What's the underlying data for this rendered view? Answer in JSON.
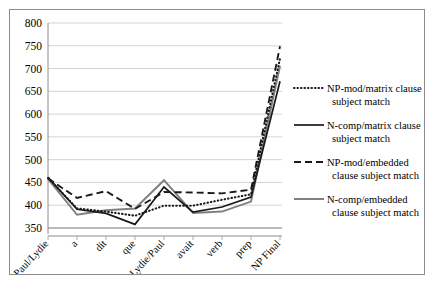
{
  "chart_data": {
    "type": "line",
    "title": "",
    "xlabel": "",
    "ylabel": "",
    "ylim": [
      350,
      800
    ],
    "ytick_step": 50,
    "yticks": [
      350,
      400,
      450,
      500,
      550,
      600,
      650,
      700,
      750,
      800
    ],
    "grid": true,
    "legend_position": "right",
    "categories": [
      "Paul/Lydie",
      "a",
      "dit",
      "que",
      "Lydie/Paul",
      "avait",
      "verb",
      "prep",
      "NP Final"
    ],
    "series": [
      {
        "name": "NP-mod/matrix clause subject match",
        "style": "dotted",
        "color": "#1a1a1a",
        "values": [
          460,
          393,
          386,
          377,
          399,
          399,
          412,
          424,
          722
        ]
      },
      {
        "name": "N-comp/matrix clause subject match",
        "style": "solid",
        "color": "#1a1a1a",
        "values": [
          461,
          391,
          382,
          358,
          440,
          385,
          396,
          418,
          672
        ]
      },
      {
        "name": "NP-mod/embedded clause subject match",
        "style": "dashed",
        "color": "#1a1a1a",
        "values": [
          459,
          416,
          431,
          392,
          429,
          428,
          426,
          434,
          749
        ]
      },
      {
        "name": "N-comp/embedded clause subject match",
        "style": "solid-gray",
        "color": "#808080",
        "values": [
          458,
          379,
          389,
          393,
          455,
          383,
          386,
          408,
          706
        ]
      }
    ]
  },
  "legend": {
    "items": [
      {
        "line1": "NP-mod/matrix clause",
        "line2": "subject match",
        "marker": "dotted-line-swatch"
      },
      {
        "line1": "N-comp/matrix clause",
        "line2": "subject match",
        "marker": "solid-line-swatch"
      },
      {
        "line1": "NP-mod/embedded",
        "line2": "clause subject match",
        "marker": "dashed-line-swatch"
      },
      {
        "line1": "N-comp/embedded",
        "line2": "clause subject match",
        "marker": "gray-line-swatch"
      }
    ]
  },
  "colors": {
    "grid": "#c8c8c8",
    "axis": "#8c8c8c",
    "frame": "#8c8c8c",
    "black_series": "#1a1a1a",
    "gray_series": "#808080",
    "background": "#ffffff"
  }
}
